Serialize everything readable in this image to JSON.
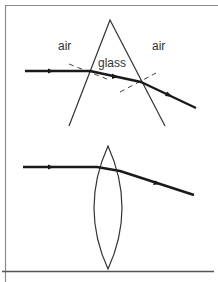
{
  "figure": {
    "colors": {
      "background": "#ffffff",
      "frame": "#8a8a8a",
      "outline": "#333333",
      "ray": "#1a1a1a",
      "normal": "#444444"
    },
    "prism_panel": {
      "labels": {
        "air_left": "air",
        "glass": "glass",
        "air_right": "air"
      },
      "prism": {
        "apex": [
          110,
          20
        ],
        "base_left": [
          69,
          126
        ],
        "base_right": [
          165,
          126
        ]
      },
      "ray": {
        "points": [
          [
            25,
            71
          ],
          [
            90,
            71
          ],
          [
            141,
            82
          ],
          [
            196,
            108
          ]
        ]
      },
      "normals": [
        {
          "from": [
            69,
            64
          ],
          "to": [
            107,
            79
          ]
        },
        {
          "from": [
            120,
            92
          ],
          "to": [
            156,
            73
          ]
        }
      ]
    },
    "lens_panel": {
      "lens": {
        "top": [
          108,
          146
        ],
        "bottom": [
          108,
          269
        ],
        "left_x": 89,
        "right_x": 127
      },
      "ray": {
        "points": [
          [
            23,
            167
          ],
          [
            97,
            167
          ],
          [
            120,
            171
          ],
          [
            194,
            195
          ]
        ]
      }
    }
  }
}
